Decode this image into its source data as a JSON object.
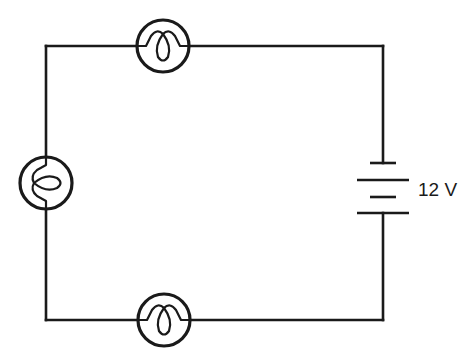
{
  "diagram": {
    "type": "circuit",
    "battery": {
      "label": "12 V",
      "cells": 2
    },
    "lamps": [
      {
        "id": "lamp-top",
        "position": "top"
      },
      {
        "id": "lamp-left",
        "position": "left"
      },
      {
        "id": "lamp-bottom",
        "position": "bottom"
      }
    ],
    "colors": {
      "line": "#1a1a1a",
      "background": "#ffffff"
    }
  }
}
